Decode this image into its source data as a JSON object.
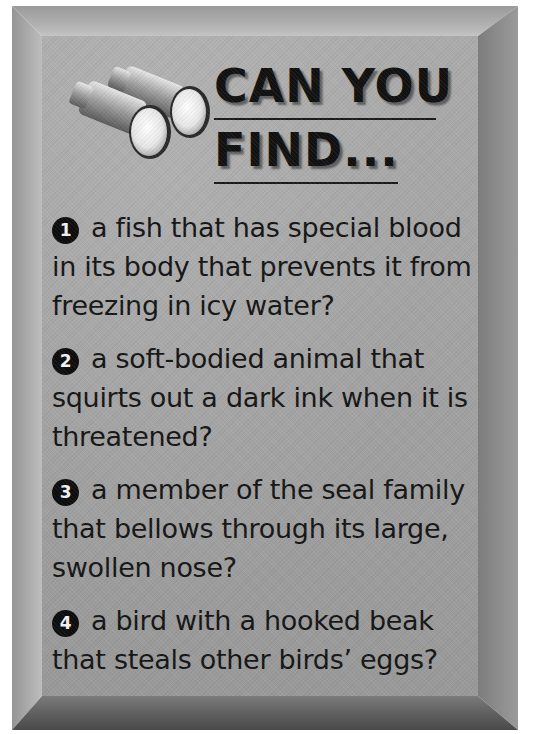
{
  "panel": {
    "title_line1": "CAN YOU",
    "title_line2": "FIND...",
    "icon": "binoculars-icon",
    "colors": {
      "face": "#a6a6a6",
      "bevel_light": "#b4b4b4",
      "bevel_dark": "#5c5c5c",
      "text": "#151515"
    }
  },
  "questions": [
    {
      "number": "1",
      "text": "a fish that has special blood in its body that prevents it from freezing in icy water?"
    },
    {
      "number": "2",
      "text": "a soft-bodied animal that squirts out a dark ink when it is threatened?"
    },
    {
      "number": "3",
      "text": "a member of the seal family that bellows through its large, swollen nose?"
    },
    {
      "number": "4",
      "text": "a bird with a hooked beak that steals other birds’ eggs?"
    }
  ]
}
